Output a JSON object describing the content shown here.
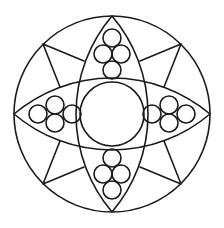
{
  "figure": {
    "stroke_color": "#1a1a1a",
    "background_color": "#ffffff"
  },
  "shapes": {
    "outer_circle": {
      "cx": 112,
      "cy": 114,
      "r": 98
    },
    "center_circle": {
      "cx": 112,
      "cy": 114,
      "r": 32
    },
    "vertical_lens": {
      "top": [
        112,
        16
      ],
      "bottom": [
        112,
        212
      ],
      "half_width": 36
    },
    "horizontal_lens": {
      "left": [
        14,
        114
      ],
      "right": [
        210,
        114
      ],
      "half_height": 36
    },
    "circle_clusters": [
      {
        "position": "top",
        "circles": [
          [
            112,
            38
          ],
          [
            103,
            54
          ],
          [
            121,
            54
          ],
          [
            112,
            70
          ]
        ],
        "r": 9
      },
      {
        "position": "bottom",
        "circles": [
          [
            112,
            190
          ],
          [
            103,
            174
          ],
          [
            121,
            174
          ],
          [
            112,
            158
          ]
        ],
        "r": 9
      },
      {
        "position": "left",
        "circles": [
          [
            38,
            114
          ],
          [
            55,
            105
          ],
          [
            55,
            123
          ],
          [
            72,
            114
          ]
        ],
        "r": 9
      },
      {
        "position": "right",
        "circles": [
          [
            186,
            114
          ],
          [
            169,
            105
          ],
          [
            169,
            123
          ],
          [
            152,
            114
          ]
        ],
        "r": 9
      }
    ],
    "kites": [
      {
        "position": "top-left",
        "outer": [
          43,
          44
        ],
        "a": [
          84,
          61
        ],
        "b": [
          60,
          87
        ]
      },
      {
        "position": "top-right",
        "outer": [
          181,
          44
        ],
        "a": [
          140,
          61
        ],
        "b": [
          164,
          87
        ]
      },
      {
        "position": "bottom-left",
        "outer": [
          43,
          184
        ],
        "a": [
          84,
          167
        ],
        "b": [
          60,
          141
        ]
      },
      {
        "position": "bottom-right",
        "outer": [
          181,
          184
        ],
        "a": [
          140,
          167
        ],
        "b": [
          164,
          141
        ]
      }
    ]
  }
}
